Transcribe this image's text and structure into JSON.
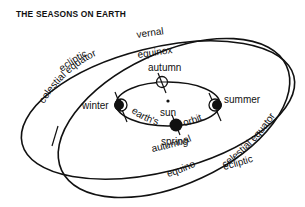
{
  "title": "THE SEASONS ON EARTH",
  "labels": {
    "ecliptic_top": "ecliptic",
    "ecliptic_bottom": "ecliptic",
    "celestial_equator_left": "celestial equator",
    "celestial_equator_right": "celestial equator",
    "vernal": "vernal",
    "vernal_equinox": "equinox",
    "autumnal": "autumnal",
    "autumnal_equinox": "equinox",
    "autumn": "autumn",
    "winter": "winter",
    "summer": "summer",
    "spring": "spring",
    "sun": "sun",
    "earths": "earth's",
    "orbit": "orbit"
  },
  "colors": {
    "ink": "#111111",
    "background": "#ffffff"
  }
}
